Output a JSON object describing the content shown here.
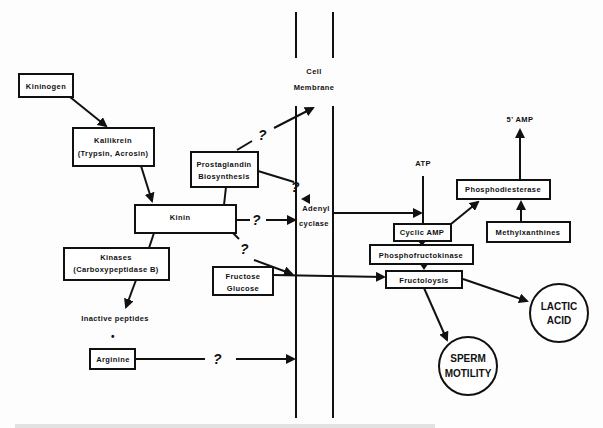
{
  "diagram": {
    "membrane": {
      "label_line1": "Cell",
      "label_line2": "Membrane"
    },
    "nodes": {
      "kininogen": "Kininogen",
      "kallikrein_line1": "Kallikrein",
      "kallikrein_line2": "(Trypsin, Acrosin)",
      "prostaglandin_line1": "Prostaglandin",
      "prostaglandin_line2": "Biosynthesis",
      "kinin": "Kinin",
      "kinases_line1": "Kinases",
      "kinases_line2": "(Carboxypeptidase B)",
      "inactive_peptides": "Inactive peptides",
      "bullet": "•",
      "arginine": "Arginine",
      "fructose": "Fructose",
      "glucose": "Glucose",
      "adenyl": "Adenyl",
      "cyclase": "cyclase",
      "atp": "ATP",
      "five_amp": "5' AMP",
      "phosphodiesterase": "Phosphodiesterase",
      "cyclic_amp": "Cyclic AMP",
      "methylxanthines": "Methylxanthines",
      "phosphofructokinase": "Phosphofructokinase",
      "fructolysis": "Fructoloysis",
      "lactic_line1": "LACTIC",
      "lactic_line2": "ACID",
      "sperm_line1": "SPERM",
      "sperm_line2": "MOTILITY"
    },
    "question_mark": "?",
    "colors": {
      "ink": "#111111",
      "background": "#fdfdfd"
    }
  }
}
